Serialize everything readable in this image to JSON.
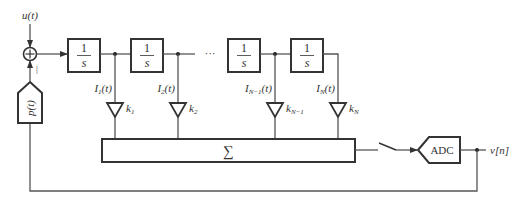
{
  "diagram": {
    "title": "",
    "input": {
      "label": "u(t)"
    },
    "summing_junction": {
      "symbol": "+",
      "feedback_sign": "|"
    },
    "feedback_block": {
      "label": "p(t)"
    },
    "integrators": [
      {
        "num": "1",
        "den": "s"
      },
      {
        "num": "1",
        "den": "s"
      },
      {
        "num": "1",
        "den": "s"
      },
      {
        "num": "1",
        "den": "s"
      }
    ],
    "ellipsis": "···",
    "states": [
      {
        "base": "I",
        "sub": "1",
        "arg": "(t)"
      },
      {
        "base": "I",
        "sub": "2",
        "arg": "(t)"
      },
      {
        "base": "I",
        "sub": "N−1",
        "arg": "(t)"
      },
      {
        "base": "I",
        "sub": "N",
        "arg": "(t)"
      }
    ],
    "gains": [
      {
        "base": "k",
        "sub": "1"
      },
      {
        "base": "k",
        "sub": "2"
      },
      {
        "base": "k",
        "sub": "N−1"
      },
      {
        "base": "k",
        "sub": "N"
      }
    ],
    "summer": {
      "label": "∑"
    },
    "switch": {
      "state": "open"
    },
    "adc": {
      "label": "ADC"
    },
    "output": {
      "label": "v[n]"
    },
    "colors": {
      "line": "#555555",
      "block": "#333333",
      "background": "#ffffff"
    }
  }
}
